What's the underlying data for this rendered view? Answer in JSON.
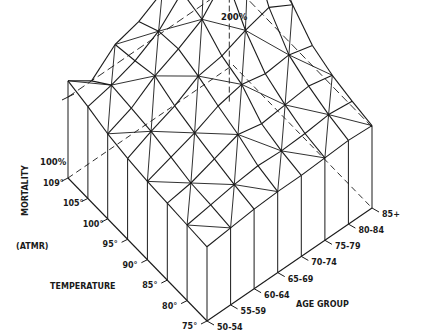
{
  "chart_data": {
    "type": "surface3d",
    "title": "",
    "zlabel": "MORTALITY (ATMR)",
    "xlabel": "TEMPERATURE",
    "ylabel": "AGE GROUP",
    "z_ticks": [
      "100%",
      "200%"
    ],
    "temperature_ticks": [
      "109°",
      "105°",
      "100°",
      "95°",
      "90°",
      "85°",
      "80°",
      "75°"
    ],
    "age_group_ticks": [
      "50-54",
      "55-59",
      "60-64",
      "65-69",
      "70-74",
      "75-79",
      "80-84",
      "85+"
    ],
    "grid_on": false,
    "legend": "none",
    "note": "Wireframe surface; rows = temperatures 109°..75°, cols = age groups 50-54..85+; values = mortality % (approx.)",
    "values": [
      [
        112,
        100,
        115,
        120,
        130,
        150,
        160,
        140
      ],
      [
        108,
        112,
        118,
        128,
        145,
        178,
        200,
        165
      ],
      [
        103,
        110,
        122,
        130,
        140,
        160,
        175,
        150
      ],
      [
        100,
        108,
        115,
        125,
        128,
        135,
        140,
        130
      ],
      [
        98,
        104,
        110,
        118,
        122,
        118,
        120,
        115
      ],
      [
        97,
        100,
        106,
        112,
        108,
        110,
        112,
        108
      ],
      [
        96,
        99,
        102,
        104,
        103,
        104,
        106,
        104
      ],
      [
        95,
        97,
        99,
        100,
        100,
        101,
        102,
        101
      ]
    ]
  }
}
